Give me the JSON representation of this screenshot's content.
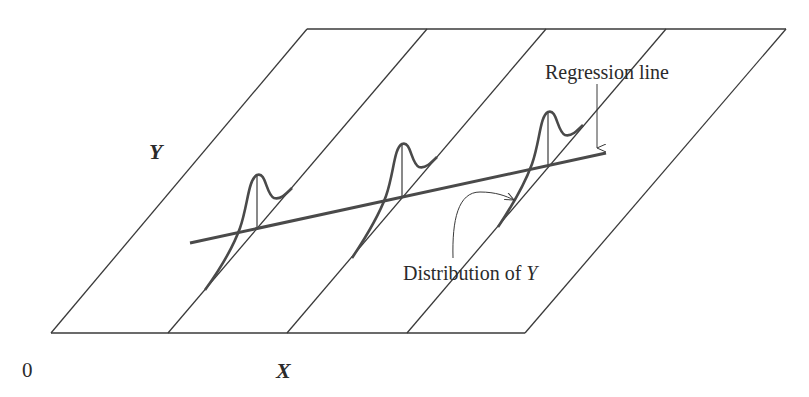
{
  "diagram": {
    "type": "regression-model-illustration",
    "labels": {
      "y_axis": "Y",
      "x_axis": "X",
      "origin": "0",
      "regression_line": "Regression line",
      "distribution_prefix": "Distribution of ",
      "distribution_var": "Y"
    },
    "colors": {
      "frame_line": "#3a3a3a",
      "curve": "#4a4a4a",
      "regression": "#4a4a4a",
      "text": "#2b2b2b",
      "background": "#ffffff"
    },
    "planes": {
      "count": 4,
      "bottom_y": 333,
      "top_y": 29,
      "bottom_x": [
        51,
        168,
        287,
        407,
        525
      ],
      "top_x": [
        307,
        427,
        546,
        666,
        786
      ]
    },
    "regression": {
      "x1": 190,
      "y1": 243,
      "x2": 606,
      "y2": 153
    },
    "distributions": [
      {
        "name": "distribution-1",
        "x_center": 257,
        "y_base": 230,
        "peak_y": 175
      },
      {
        "name": "distribution-2",
        "x_center": 402,
        "y_base": 198,
        "peak_y": 144
      },
      {
        "name": "distribution-3",
        "x_center": 548,
        "y_base": 166,
        "peak_y": 112
      }
    ]
  }
}
